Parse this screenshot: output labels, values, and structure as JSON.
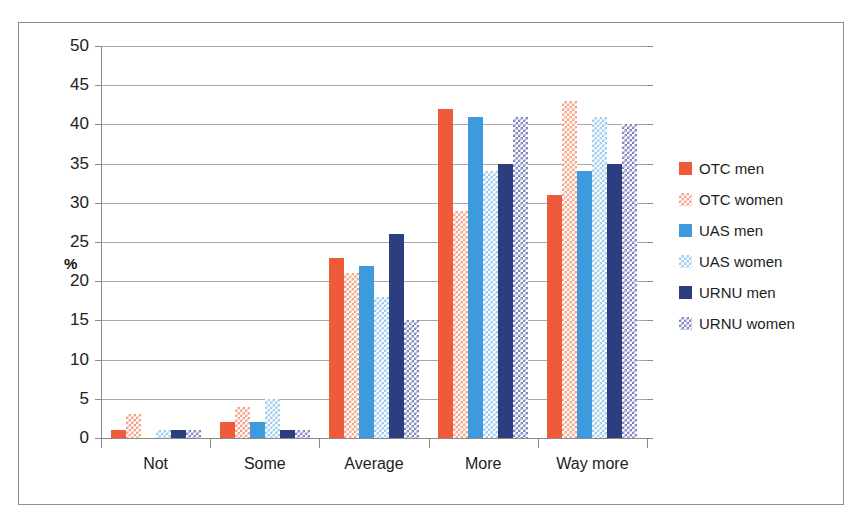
{
  "chart_data": {
    "type": "bar",
    "title": "",
    "xlabel": "",
    "ylabel": "%",
    "ylim": [
      0,
      50
    ],
    "ytick_step": 5,
    "yticks": [
      50,
      45,
      40,
      35,
      30,
      25,
      20,
      15,
      10,
      5,
      0
    ],
    "grid": true,
    "legend_position": "right",
    "categories": [
      "Not",
      "Some",
      "Average",
      "More",
      "Way more"
    ],
    "series": [
      {
        "name": "OTC men",
        "color": "#EE5A3A",
        "pattern": "solid",
        "values": [
          1,
          2,
          23,
          42,
          31
        ]
      },
      {
        "name": "OTC women",
        "color": "#F4A084",
        "pattern": "checkered",
        "values": [
          3,
          4,
          21,
          29,
          43
        ]
      },
      {
        "name": "UAS men",
        "color": "#3D9BDD",
        "pattern": "solid",
        "values": [
          0,
          2,
          22,
          41,
          34
        ]
      },
      {
        "name": "UAS women",
        "color": "#9ACBEE",
        "pattern": "checkered",
        "values": [
          1,
          5,
          18,
          34,
          41
        ]
      },
      {
        "name": "URNU men",
        "color": "#2C3E80",
        "pattern": "solid",
        "values": [
          1,
          1,
          26,
          35,
          35
        ]
      },
      {
        "name": "URNU women",
        "color": "#7C82BE",
        "pattern": "checkered",
        "values": [
          1,
          1,
          15,
          41,
          40
        ]
      }
    ]
  },
  "axis": {
    "y_title": "%"
  }
}
